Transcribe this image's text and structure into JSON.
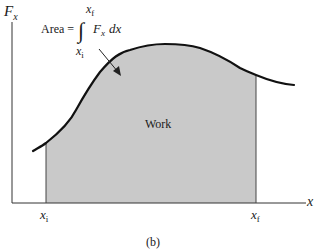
{
  "figure": {
    "y_axis_label": "F",
    "y_axis_subscript": "x",
    "x_axis_label": "x",
    "x_initial_label": "x",
    "x_initial_subscript": "i",
    "x_final_label": "x",
    "x_final_subscript": "f",
    "region_label": "Work",
    "caption": "(b)",
    "equation": {
      "lhs": "Area =",
      "integral_symbol": "∫",
      "upper_limit": "x",
      "upper_limit_subscript": "f",
      "lower_limit": "x",
      "lower_limit_subscript": "i",
      "integrand": "F",
      "integrand_subscript": "x",
      "differential": "dx"
    },
    "colors": {
      "shaded_area": "#c8c8c8",
      "curve": "#111111",
      "axes": "#333333"
    }
  }
}
